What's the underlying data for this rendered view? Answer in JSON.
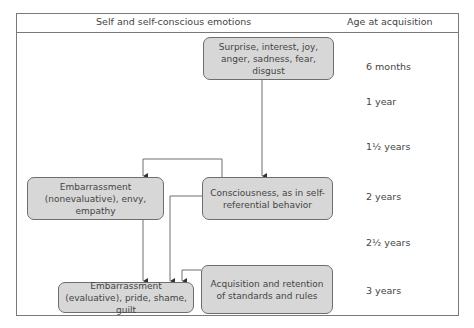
{
  "header": {
    "left_title": "Self and self-conscious emotions",
    "right_title": "Age at acquisition"
  },
  "nodes": {
    "primary_emotions": "Surprise, interest, joy, anger, sadness, fear, disgust",
    "consciousness": "Consciousness, as in self-referential behavior",
    "nonevaluative": "Embarrassment (nonevaluative), envy, empathy",
    "standards": "Acquisition and retention of standards and rules",
    "evaluative": "Embarrassment (evaluative), pride, shame, guilt"
  },
  "ages": [
    "6 months",
    "1 year",
    "1½ years",
    "2 years",
    "2½ years",
    "3 years"
  ],
  "colors": {
    "box_fill": "#d7d7d7",
    "line": "#6e6e6e"
  }
}
